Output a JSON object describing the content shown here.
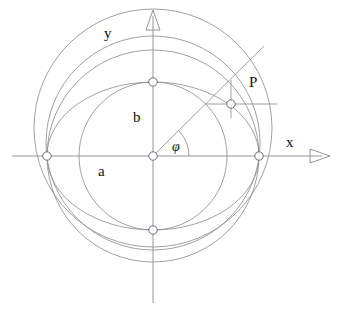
{
  "figure": {
    "type": "geometric-diagram",
    "background_color": "#ffffff",
    "stroke_color": "#7a7a84",
    "label_color": "#111111",
    "axes": {
      "x_label": "x",
      "y_label": "y",
      "origin": {
        "x": 153,
        "y": 156
      },
      "x_axis": {
        "from_x": 12,
        "to_x": 330,
        "y": 156,
        "arrow": "right"
      },
      "y_axis": {
        "x": 153,
        "from_y": 303,
        "to_y": 10,
        "arrow": "up"
      }
    },
    "labels": {
      "semi_major": "a",
      "semi_minor": "b",
      "point": "P",
      "angle": "φ"
    },
    "geometry": {
      "semi_major_a": 106,
      "semi_minor_b": 74,
      "angle_phi_deg": 43,
      "ellipse_center": {
        "x": 153,
        "y": 156
      },
      "circle_a_radius": 106,
      "circle_b_radius": 74,
      "extra_circle_1": {
        "cx": 153,
        "cy": 128,
        "r": 119
      },
      "extra_circle_2": {
        "cx": 153,
        "cy": 143,
        "r": 107
      },
      "point_P": {
        "x": 231,
        "y": 104
      },
      "ray_intersection_outer": {
        "x": 231,
        "y": 84
      },
      "ray_end": {
        "x": 262,
        "y": 48
      },
      "angle_arc_radius": 36
    },
    "markers": [
      {
        "name": "origin",
        "x": 153,
        "y": 156
      },
      {
        "name": "vertex-right",
        "x": 259,
        "y": 156
      },
      {
        "name": "vertex-left",
        "x": 47,
        "y": 156
      },
      {
        "name": "covertex-top",
        "x": 153,
        "y": 82
      },
      {
        "name": "covertex-bottom",
        "x": 153,
        "y": 230
      },
      {
        "name": "point-P",
        "x": 231,
        "y": 104
      }
    ]
  }
}
